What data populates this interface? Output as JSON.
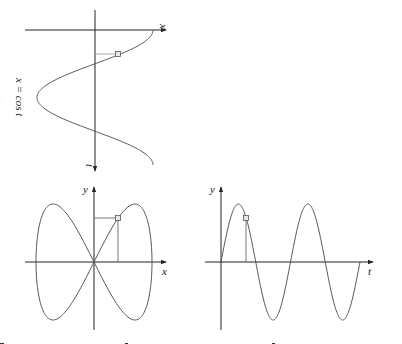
{
  "figure": {
    "panels": [
      {
        "id": "top",
        "description": "x = cos t plotted with t on downward vertical axis",
        "equation_label": "x = cos t",
        "horizontal_axis_label": "x",
        "vertical_axis_label": "t"
      },
      {
        "id": "bottom-left",
        "description": "parametric curve (cos t, sin 2t) figure-eight",
        "horizontal_axis_label": "x",
        "vertical_axis_label": "y"
      },
      {
        "id": "bottom-right",
        "description": "y = sin 2t plotted against t",
        "horizontal_axis_label": "t",
        "vertical_axis_label": "y"
      }
    ],
    "colors": {
      "axis": "#222222",
      "curve": "#555555",
      "marker_fill": "#e8e8e8",
      "background": "#ffffff"
    }
  }
}
